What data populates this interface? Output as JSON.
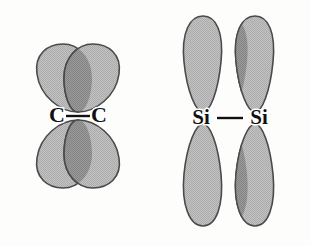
{
  "figure": {
    "background_color": "#fdfdfc",
    "lobe_fill_color": "#b9b9b9",
    "lobe_overlap_color": "#8e8e8e",
    "lobe_outline_color": "#4a4a4a",
    "label_color": "#111111",
    "label_halo_color": "#ffffff"
  },
  "diagrams": [
    {
      "id": "carbon-bond",
      "element_symbol": "C",
      "left_atom_label": "C",
      "right_atom_label": "C",
      "bond_symbol": "—",
      "lobe_count": 4,
      "lobe_shape": "short-wide-teardrop",
      "overlap": "large",
      "center_x": 78,
      "center_y": 115
    },
    {
      "id": "silicon-bond",
      "element_symbol": "Si",
      "left_atom_label": "Si",
      "right_atom_label": "Si",
      "bond_symbol": "—",
      "lobe_count": 4,
      "lobe_shape": "long-narrow-teardrop",
      "overlap": "small",
      "center_x": 230,
      "center_y": 118
    }
  ],
  "labels": {
    "carbon_left": "C",
    "carbon_right": "C",
    "silicon_left": "Si",
    "silicon_right": "Si"
  }
}
